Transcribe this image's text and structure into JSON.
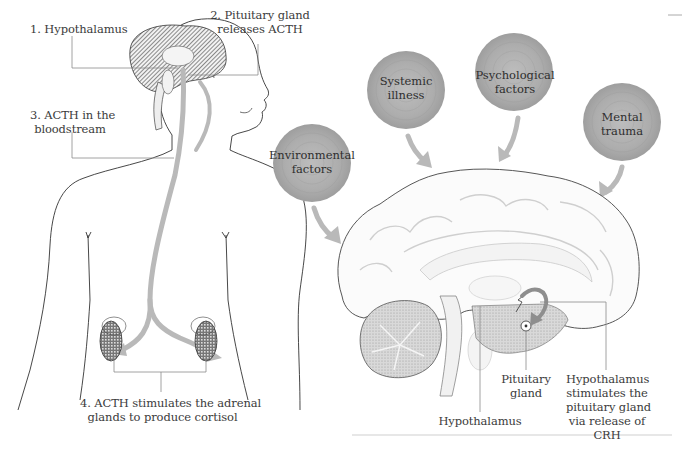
{
  "body_diagram": {
    "labels": {
      "step1": "1. Hypothalamus",
      "step2_line1": "2. Pituitary gland",
      "step2_line2": "releases ACTH",
      "step3_line1": "3. ACTH in the",
      "step3_line2": "bloodstream",
      "step4_line1": "4. ACTH stimulates the adrenal",
      "step4_line2": "glands to produce cortisol"
    }
  },
  "stress_factors": [
    {
      "line1": "Environmental",
      "line2": "factors"
    },
    {
      "line1": "Systemic",
      "line2": "illness"
    },
    {
      "line1": "Psychological",
      "line2": "factors"
    },
    {
      "line1": "Mental",
      "line2": "trauma"
    }
  ],
  "brain_diagram": {
    "labels": {
      "hypothalamus": "Hypothalamus",
      "pituitary_line1": "Pituitary",
      "pituitary_line2": "gland",
      "crh_line1": "Hypothalamus",
      "crh_line2": "stimulates the",
      "crh_line3": "pituitary gland",
      "crh_line4": "via release of",
      "crh_line5": "CRH"
    }
  },
  "colors": {
    "arrow": "#b9b9b9",
    "bubble": "#a9a9a9",
    "outline": "#333333",
    "leader_line": "#8a8a8a",
    "text": "#3b3b3b"
  }
}
